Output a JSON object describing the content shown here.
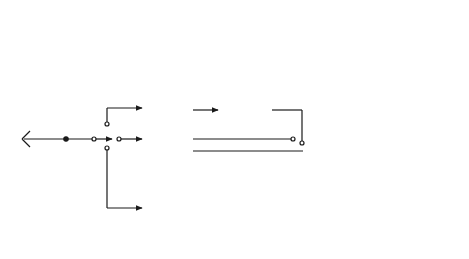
{
  "diagram": {
    "type": "block-diagram",
    "blocks": [
      {
        "id": "ac_attenuator",
        "line1": "Ac",
        "line2": "attenuator"
      },
      {
        "id": "ac_converter",
        "line1": "Ac",
        "line2": "converter"
      },
      {
        "id": "dc_attenuator",
        "line1": "Dc",
        "line2": "attenuator"
      },
      {
        "id": "ohms_converter",
        "line1": "Ohms",
        "line2": "converter"
      },
      {
        "id": "shunts",
        "line1": "Shunts",
        "line2": ""
      },
      {
        "id": "digital_display",
        "line1": "Digital",
        "line2": "display"
      },
      {
        "id": "ad_converter",
        "line1": "A/D",
        "line2": "converter"
      },
      {
        "id": "precision_reference",
        "line1": "Precision",
        "line2": "reference"
      },
      {
        "id": "bcd_output",
        "line1": "BCD",
        "line2": "output"
      },
      {
        "id": "ieee488_interface",
        "line1": "IEEE-488",
        "line2": "interface"
      }
    ],
    "labels": {
      "hi": "Hi",
      "lo": "Lo",
      "input": "Input",
      "amps": "Amps",
      "left_ac": "Ac",
      "left_dc": "Dc",
      "left_ohms": "Ohms",
      "right_ac": "Ac",
      "right_dc": "Dc",
      "right_ohms": "Ohms"
    },
    "connections": [
      [
        "Hi",
        "function switch (Ac/Dc/Ohms)"
      ],
      [
        "Hi",
        "Amps switch"
      ],
      [
        "Amps switch",
        "Shunts"
      ],
      [
        "Shunts",
        "Lo"
      ],
      [
        "Lo",
        "ground"
      ],
      [
        "switch Ac",
        "Ac attenuator"
      ],
      [
        "Ac attenuator",
        "Ac converter"
      ],
      [
        "Ac converter",
        "output switch Ac"
      ],
      [
        "switch Dc",
        "Dc attenuator"
      ],
      [
        "Dc attenuator",
        "output switch Dc"
      ],
      [
        "switch Ohms",
        "Ohms converter"
      ],
      [
        "Ohms converter",
        "output switch Ohms"
      ],
      [
        "output switch",
        "A/D converter"
      ],
      [
        "A/D converter",
        "Digital display"
      ],
      [
        "Precision reference",
        "A/D converter"
      ],
      [
        "A/D converter",
        "BCD output"
      ],
      [
        "A/D converter",
        "IEEE-488 interface"
      ]
    ],
    "colors": {
      "line": "#1a1a1a",
      "background": "#ffffff"
    }
  }
}
